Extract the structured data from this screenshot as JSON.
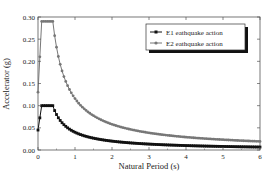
{
  "chart_data": {
    "type": "line",
    "title": "",
    "xlabel": "Natural Period (s)",
    "ylabel": "Accelerator (g)",
    "xlim": [
      0,
      6
    ],
    "ylim": [
      0,
      0.3
    ],
    "xticks": [
      "0",
      "1",
      "2",
      "3",
      "4",
      "5",
      "6"
    ],
    "yticks": [
      "0.00",
      "0.05",
      "0.10",
      "0.15",
      "0.20",
      "0.25",
      "0.30"
    ],
    "grid": false,
    "legend_position": "top-right",
    "series": [
      {
        "name": "E1 eathquake action",
        "color": "#111111",
        "marker": "square",
        "peak": 0.1,
        "tb": 0.1,
        "tc": 0.4,
        "x": [
          0,
          0.05,
          0.1,
          0.4,
          0.6,
          0.8,
          1.0,
          1.5,
          2.0,
          3.0,
          4.0,
          5.0,
          6.0
        ],
        "values": [
          0.045,
          0.075,
          0.1,
          0.1,
          0.067,
          0.05,
          0.04,
          0.027,
          0.02,
          0.013,
          0.01,
          0.008,
          0.007
        ]
      },
      {
        "name": "E2 eathquake action",
        "color": "#777777",
        "marker": "circle",
        "peak": 0.29,
        "tb": 0.1,
        "tc": 0.4,
        "x": [
          0,
          0.05,
          0.1,
          0.4,
          0.6,
          0.8,
          1.0,
          1.5,
          2.0,
          3.0,
          4.0,
          5.0,
          6.0
        ],
        "values": [
          0.13,
          0.225,
          0.29,
          0.29,
          0.193,
          0.145,
          0.116,
          0.077,
          0.058,
          0.039,
          0.029,
          0.023,
          0.019
        ]
      }
    ]
  }
}
